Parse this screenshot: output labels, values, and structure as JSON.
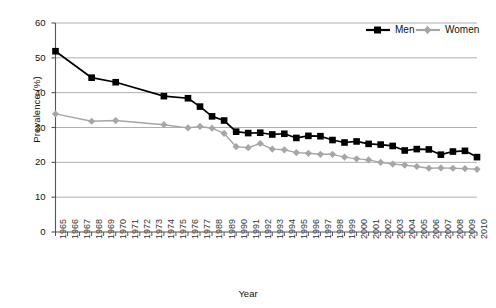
{
  "chart_data": {
    "type": "line",
    "title": "",
    "xlabel": "Year",
    "ylabel": "Prevalence (%)",
    "ylim": [
      0,
      60
    ],
    "yticks": [
      0,
      10,
      20,
      30,
      40,
      50,
      60
    ],
    "grid": true,
    "legend_position": "top-right",
    "categories": [
      "1965",
      "1966",
      "1967",
      "1968",
      "1969",
      "1970",
      "1971",
      "1972",
      "1973",
      "1974",
      "1975",
      "1976",
      "1977",
      "1988",
      "1989",
      "1990",
      "1991",
      "1992",
      "1993",
      "1994",
      "1995",
      "1996",
      "1997",
      "1998",
      "1999",
      "2000",
      "2001",
      "2002",
      "2003",
      "2004",
      "2005",
      "2006",
      "2007",
      "2008",
      "2009",
      "2010"
    ],
    "series": [
      {
        "name": "Men",
        "color": "#000000",
        "marker": "square",
        "values": [
          51.9,
          null,
          null,
          44.3,
          null,
          43.0,
          null,
          null,
          null,
          39.0,
          null,
          38.4,
          36.0,
          33.2,
          32.0,
          28.8,
          28.4,
          28.5,
          28.0,
          28.2,
          27.0,
          27.6,
          27.5,
          26.4,
          25.7,
          26.0,
          25.3,
          25.1,
          24.7,
          23.4,
          23.8,
          23.7,
          22.2,
          23.1,
          23.3,
          21.5
        ]
      },
      {
        "name": "Women",
        "color": "#a6a6a6",
        "marker": "diamond",
        "values": [
          33.9,
          null,
          null,
          31.8,
          null,
          32.0,
          null,
          null,
          null,
          30.8,
          null,
          29.9,
          30.3,
          29.8,
          28.3,
          24.5,
          24.2,
          25.4,
          23.8,
          23.6,
          22.8,
          22.6,
          22.3,
          22.3,
          21.5,
          21.0,
          20.7,
          20.0,
          19.5,
          19.2,
          18.8,
          18.3,
          18.4,
          18.3,
          18.2,
          18.0
        ]
      }
    ]
  },
  "legend": {
    "items": [
      {
        "label": "Men"
      },
      {
        "label": "Women"
      }
    ]
  }
}
